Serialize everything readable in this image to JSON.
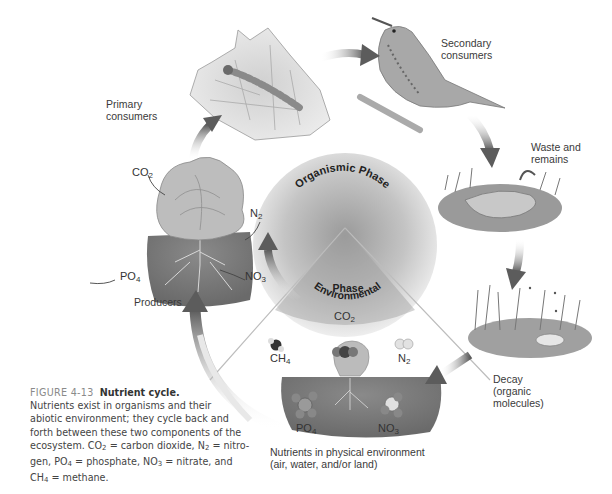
{
  "figure": {
    "number_label": "FIGURE 4-13",
    "title": "Nutrient cycle.",
    "caption_lines": [
      "Nutrients exist in organisms and their",
      "abiotic environment; they cycle back and",
      "forth between these two components of the"
    ],
    "caption_formula_text": {
      "ecosystem": "ecosystem.",
      "co2_def": "= carbon dioxide,",
      "n2_def": "= nitro-",
      "gen": "gen,",
      "po4_def": "= phosphate,",
      "no3_def": "= nitrate, and",
      "ch4_def": "= methane."
    }
  },
  "diagram": {
    "center": {
      "organismic_phase": "Organismic Phase",
      "environmental_phase_line1": "Environmental",
      "environmental_phase_line2": "Phase"
    },
    "stages": {
      "primary_consumers": [
        "Primary",
        "consumers"
      ],
      "secondary_consumers": [
        "Secondary",
        "consumers"
      ],
      "waste": [
        "Waste and",
        "remains"
      ],
      "decay": [
        "Decay",
        "(organic",
        "molecules)"
      ],
      "environment": [
        "Nutrients in physical environment",
        "(air, water, and/or land)"
      ],
      "producers": [
        "Producers"
      ]
    },
    "molecules": {
      "co2": {
        "base": "CO",
        "sub": "2"
      },
      "n2": {
        "base": "N",
        "sub": "2"
      },
      "po4": {
        "base": "PO",
        "sub": "4"
      },
      "no3": {
        "base": "NO",
        "sub": "3"
      },
      "ch4": {
        "base": "CH",
        "sub": "4"
      }
    },
    "colors": {
      "arrow": "#6e6e6e",
      "soil": "#7a7a7a",
      "sphere": "#bdbdbd",
      "text": "#3a3a3a"
    }
  }
}
